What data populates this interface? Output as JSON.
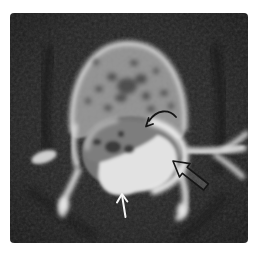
{
  "figure": {
    "page_background": "#ffffff",
    "scan_background": "#1d1d1d",
    "bone_bright": "#e8e8e8",
    "trabecular_gray": "#8d8d8d",
    "canal_gray": "#6e6e6e",
    "herniation_gray": "#7d7d7d",
    "thecal_sac_bright": "#e2e2e2",
    "annotations": {
      "curved_arrow": {
        "label": "curved black arrow",
        "color": "#141414",
        "direction": "points down-left into top of spinal canal"
      },
      "open_arrow": {
        "label": "open black arrow",
        "color": "#161616",
        "direction": "points up-left at right canal margin"
      },
      "white_arrow": {
        "label": "straight white arrow",
        "color": "#f6f6f6",
        "direction": "points up at bottom canal margin"
      }
    }
  }
}
